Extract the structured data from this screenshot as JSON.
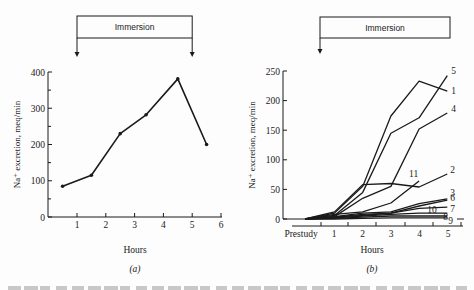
{
  "figure_caption": "",
  "chart_data": [
    {
      "type": "line",
      "panel_label": "(a)",
      "title": "",
      "xlabel": "Hours",
      "ylabel": "Na⁺ excretion, meq/min",
      "xlim": [
        0,
        6
      ],
      "ylim": [
        0,
        400
      ],
      "x_ticks": [
        1,
        2,
        3,
        4,
        5,
        6
      ],
      "x_tick_labels": [
        "1",
        "2",
        "3",
        "4",
        "5",
        "6"
      ],
      "y_ticks": [
        0,
        100,
        200,
        300,
        400
      ],
      "y_tick_labels": [
        "0",
        "100",
        "200",
        "300",
        "400"
      ],
      "y_minor_ticks": [
        50,
        150,
        250,
        350
      ],
      "annotation": {
        "label": "Immersion",
        "start_hour": 1,
        "end_hour": 5
      },
      "series": [
        {
          "name": "Mean",
          "x": [
            0.5,
            1.5,
            2.5,
            3.4,
            4.5,
            5.5
          ],
          "y": [
            85,
            115,
            230,
            282,
            381,
            200
          ]
        }
      ]
    },
    {
      "type": "line",
      "panel_label": "(b)",
      "title": "",
      "xlabel": "Hours",
      "ylabel": "Na⁺ excretion, meq/min",
      "ylim": [
        0,
        250
      ],
      "x_categories": [
        "Prestudy",
        "1",
        "2",
        "3",
        "4",
        "5"
      ],
      "y_ticks": [
        0,
        50,
        100,
        150,
        200,
        250
      ],
      "y_tick_labels": [
        "0",
        "50",
        "100",
        "150",
        "200",
        "250"
      ],
      "annotation": {
        "label": "Immersion",
        "start_hour": 0
      },
      "series": [
        {
          "name": "1",
          "y": [
            0,
            10,
            55,
            174,
            233,
            216
          ]
        },
        {
          "name": "5",
          "y": [
            0,
            6,
            45,
            145,
            171,
            242
          ]
        },
        {
          "name": "4",
          "y": [
            0,
            4,
            35,
            55,
            152,
            179
          ]
        },
        {
          "name": "2",
          "y": [
            0,
            12,
            58,
            60,
            54,
            76
          ]
        },
        {
          "name": "11",
          "y": [
            0,
            8,
            12,
            27,
            64,
            null
          ]
        },
        {
          "name": "3",
          "y": [
            0,
            4,
            10,
            12,
            26,
            34
          ]
        },
        {
          "name": "6",
          "y": [
            0,
            3,
            8,
            10,
            22,
            32
          ]
        },
        {
          "name": "7",
          "y": [
            0,
            3,
            6,
            10,
            18,
            20
          ]
        },
        {
          "name": "10",
          "y": [
            0,
            2,
            5,
            8,
            10,
            10
          ]
        },
        {
          "name": "8",
          "y": [
            0,
            1,
            3,
            5,
            5,
            5
          ]
        },
        {
          "name": "9",
          "y": [
            0,
            0,
            1,
            2,
            2,
            2
          ]
        }
      ]
    }
  ]
}
